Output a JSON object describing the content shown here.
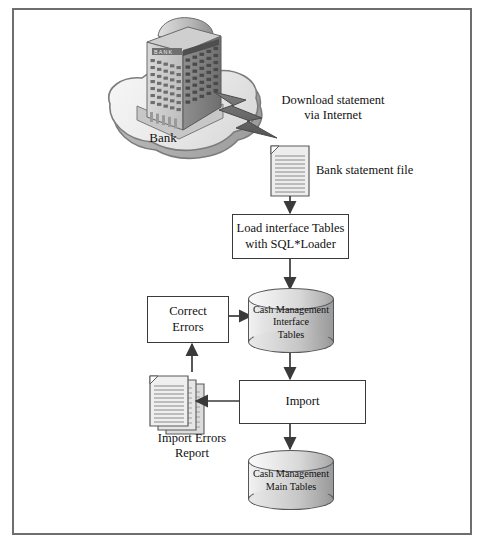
{
  "diagram": {
    "frame": {
      "border_color": "#6e6e6e",
      "background": "#ffffff"
    },
    "bank": {
      "label": "Bank",
      "building_sign": "BANK",
      "platform_name": "cloud-platform"
    },
    "download_arrow": {
      "label": "Download statement\nvia Internet",
      "shape": "lightning-bolt"
    },
    "bank_statement_file": {
      "label": "Bank statement file",
      "icon": "document-icon"
    },
    "load_box": {
      "label": "Load interface Tables\nwith SQL*Loader"
    },
    "interface_tables": {
      "label": "Cash Management\nInterface\nTables",
      "icon": "database-cylinder-icon"
    },
    "correct_errors_box": {
      "label": "Correct\nErrors"
    },
    "import_box": {
      "label": "Import"
    },
    "import_errors_report": {
      "label": "Import Errors\nReport",
      "icon": "document-stack-icon"
    },
    "main_tables": {
      "label": "Cash Management\nMain Tables",
      "icon": "database-cylinder-icon"
    },
    "colors": {
      "line": "#3a3a3a",
      "cylinder_stroke": "#55565a",
      "text": "#111111",
      "frame": "#6e6e6e"
    }
  }
}
